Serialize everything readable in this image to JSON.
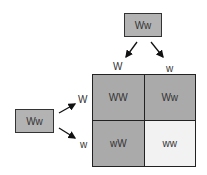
{
  "parents": {
    "top": {
      "genotype": "Ww",
      "gametes": [
        "W",
        "w"
      ]
    },
    "left": {
      "genotype": "Ww",
      "gametes": [
        "W",
        "w"
      ]
    }
  },
  "punnett": {
    "cells": [
      {
        "genotype": "WW",
        "color": "#aaaaaa"
      },
      {
        "genotype": "Ww",
        "color": "#aaaaaa"
      },
      {
        "genotype": "wW",
        "color": "#aaaaaa"
      },
      {
        "genotype": "ww",
        "color": "#f2f2f2"
      }
    ]
  }
}
